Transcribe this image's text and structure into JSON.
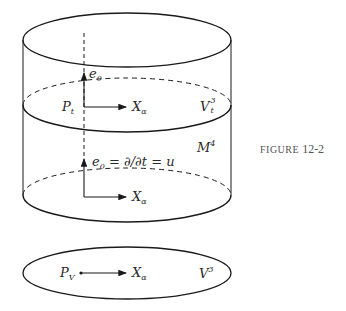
{
  "figure": {
    "caption_word": "FIGURE",
    "caption_number": "12-2"
  },
  "labels": {
    "top_e0": {
      "base": "e",
      "sub": "0"
    },
    "top_point": {
      "base": "P",
      "sub": "t"
    },
    "top_vector": {
      "base": "X",
      "sub": "α"
    },
    "slice_space": {
      "base": "V",
      "sup": "3",
      "sub": "t"
    },
    "manifold": {
      "base": "M",
      "sup": "4"
    },
    "mid_e0_eq": {
      "base": "e",
      "sub": "0",
      "rest": " = ∂/∂t = u"
    },
    "mid_vector": {
      "base": "X",
      "sub": "α"
    },
    "bottom_point": {
      "base": "P",
      "sub": "V"
    },
    "bottom_vector": {
      "base": "X",
      "sub": "α"
    },
    "bottom_space": {
      "base": "V",
      "sup": "3"
    }
  },
  "colors": {
    "stroke": "#1a1a1a",
    "text": "#2a2a2a",
    "caption": "#555555"
  }
}
